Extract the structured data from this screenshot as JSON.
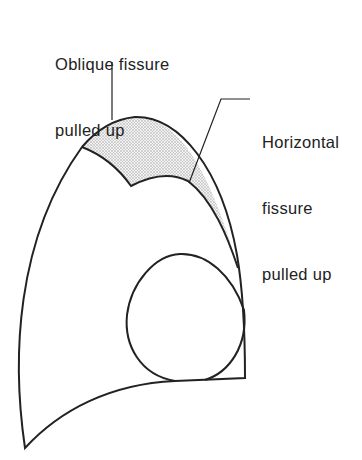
{
  "diagram": {
    "labels": {
      "oblique": {
        "line1": "Oblique fissure",
        "line2": "pulled up"
      },
      "horizontal": {
        "line1": "Horizontal",
        "line2": "fissure",
        "line3": "pulled up"
      }
    },
    "colors": {
      "stroke": "#222222",
      "shade": "#d9d9d9",
      "background": "#ffffff"
    }
  }
}
